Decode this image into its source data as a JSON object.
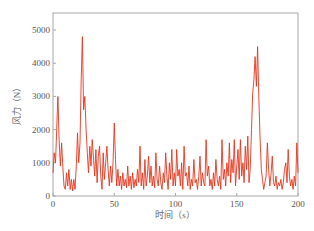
{
  "chart_data": {
    "type": "line",
    "title": "",
    "xlabel": "时间（s）",
    "ylabel": "风力（N）",
    "xlim": [
      0,
      200
    ],
    "ylim": [
      0,
      5500
    ],
    "xticks": [
      0,
      50,
      100,
      150,
      200
    ],
    "yticks": [
      0,
      1000,
      2000,
      3000,
      4000,
      5000
    ],
    "grid": false,
    "legend": null,
    "series": [
      {
        "name": "风力",
        "color": "#e8341c",
        "x": [
          0,
          1,
          2,
          3,
          4,
          5,
          6,
          7,
          8,
          9,
          10,
          11,
          12,
          13,
          14,
          15,
          16,
          17,
          18,
          19,
          20,
          21,
          22,
          23,
          24,
          25,
          26,
          27,
          28,
          29,
          30,
          31,
          32,
          33,
          34,
          35,
          36,
          37,
          38,
          39,
          40,
          41,
          42,
          43,
          44,
          45,
          46,
          47,
          48,
          49,
          50,
          51,
          52,
          53,
          54,
          55,
          56,
          57,
          58,
          59,
          60,
          61,
          62,
          63,
          64,
          65,
          66,
          67,
          68,
          69,
          70,
          71,
          72,
          73,
          74,
          75,
          76,
          77,
          78,
          79,
          80,
          81,
          82,
          83,
          84,
          85,
          86,
          87,
          88,
          89,
          90,
          91,
          92,
          93,
          94,
          95,
          96,
          97,
          98,
          99,
          100,
          101,
          102,
          103,
          104,
          105,
          106,
          107,
          108,
          109,
          110,
          111,
          112,
          113,
          114,
          115,
          116,
          117,
          118,
          119,
          120,
          121,
          122,
          123,
          124,
          125,
          126,
          127,
          128,
          129,
          130,
          131,
          132,
          133,
          134,
          135,
          136,
          137,
          138,
          139,
          140,
          141,
          142,
          143,
          144,
          145,
          146,
          147,
          148,
          149,
          150,
          151,
          152,
          153,
          154,
          155,
          156,
          157,
          158,
          159,
          160,
          161,
          162,
          163,
          164,
          165,
          166,
          167,
          168,
          169,
          170,
          171,
          172,
          173,
          174,
          175,
          176,
          177,
          178,
          179,
          180,
          181,
          182,
          183,
          184,
          185,
          186,
          187,
          188,
          189,
          190,
          191,
          192,
          193,
          194,
          195,
          196,
          197,
          198,
          199,
          200
        ],
        "values": [
          700,
          1300,
          1000,
          2000,
          3000,
          1700,
          900,
          1600,
          900,
          300,
          200,
          700,
          300,
          800,
          200,
          500,
          150,
          500,
          200,
          900,
          1900,
          1000,
          1600,
          3500,
          4800,
          2600,
          3000,
          2000,
          1300,
          700,
          1500,
          900,
          1700,
          1200,
          600,
          1400,
          400,
          1200,
          1500,
          600,
          200,
          1300,
          500,
          1000,
          1500,
          800,
          300,
          900,
          400,
          1000,
          2200,
          1100,
          300,
          800,
          300,
          600,
          200,
          700,
          300,
          500,
          250,
          900,
          300,
          600,
          200,
          700,
          250,
          500,
          300,
          800,
          400,
          1500,
          300,
          700,
          200,
          1100,
          300,
          600,
          1200,
          400,
          900,
          300,
          600,
          250,
          1300,
          500,
          300,
          900,
          400,
          200,
          700,
          400,
          1300,
          600,
          200,
          1000,
          500,
          1400,
          300,
          700,
          300,
          1400,
          600,
          800,
          300,
          1000,
          200,
          1500,
          600,
          700,
          300,
          900,
          200,
          500,
          300,
          1100,
          400,
          500,
          200,
          600,
          1200,
          300,
          700,
          400,
          300,
          1700,
          600,
          900,
          300,
          500,
          200,
          700,
          300,
          1100,
          500,
          300,
          600,
          200,
          1700,
          500,
          800,
          300,
          1000,
          600,
          1600,
          400,
          1100,
          700,
          1700,
          300,
          900,
          1400,
          500,
          1700,
          600,
          1000,
          400,
          1500,
          800,
          1800,
          400,
          800,
          2000,
          3100,
          3500,
          4200,
          3300,
          4500,
          3000,
          1800,
          800,
          500,
          200,
          400,
          600,
          1600,
          800,
          300,
          700,
          1200,
          400,
          300,
          600,
          200,
          400,
          300,
          500,
          200,
          400,
          800,
          1000,
          400,
          1400,
          600,
          300,
          500,
          200,
          600,
          300,
          1600,
          700
        ]
      }
    ]
  }
}
